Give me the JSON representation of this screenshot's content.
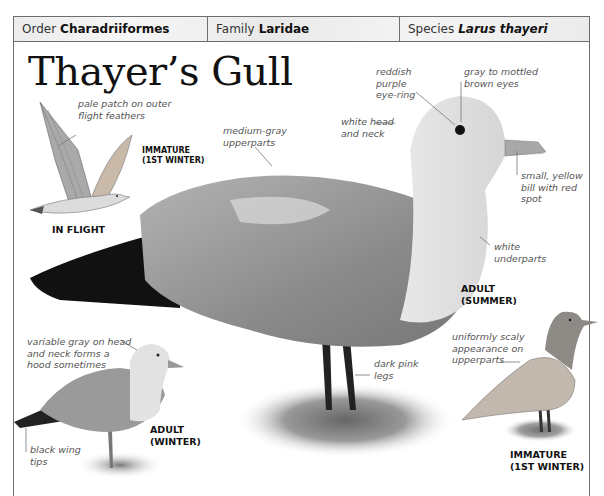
{
  "header": {
    "order": {
      "key": "Order",
      "value": "Charadriiformes"
    },
    "family": {
      "key": "Family",
      "value": "Laridae"
    },
    "species": {
      "key": "Species",
      "value": "Larus thayeri"
    }
  },
  "title": "Thayer’s Gull",
  "illustrations": {
    "in_flight": {
      "caption": "IN FLIGHT",
      "age": "IMMATURE\n(1ST WINTER)",
      "annotations": [
        "pale patch on outer\nflight feathers"
      ]
    },
    "adult_summer": {
      "caption": "ADULT\n(SUMMER)",
      "annotations": {
        "eye_ring": "reddish\npurple\neye-ring",
        "eyes": "gray to mottled\nbrown eyes",
        "head": "white head\nand neck",
        "upperparts": "medium-gray\nupperparts",
        "bill": "small, yellow\nbill with red\nspot",
        "underparts": "white\nunderparts",
        "legs": "dark pink\nlegs"
      }
    },
    "adult_winter": {
      "caption": "ADULT\n(WINTER)",
      "annotations": {
        "hood": "variable gray on head\nand neck forms a\nhood sometimes",
        "wingtips": "black wing\ntips"
      }
    },
    "immature": {
      "caption": "IMMATURE\n(1ST WINTER)",
      "annotations": {
        "upperparts": "uniformly scaly\nappearance on\nupperparts"
      }
    }
  },
  "colors": {
    "border": "#6e6e6e",
    "header_bg": "#eeeeee",
    "label_text": "#555555",
    "gull_gray": "#8f8f8f",
    "wingtip_black": "#111111"
  }
}
